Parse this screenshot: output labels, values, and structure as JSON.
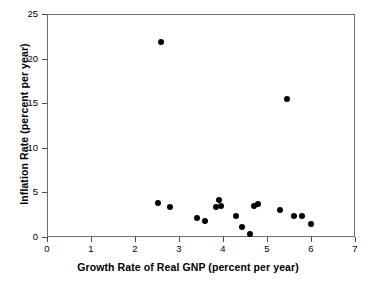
{
  "chart_data": {
    "type": "scatter",
    "title": "",
    "xlabel": "Growth Rate of Real GNP (percent per year)",
    "ylabel": "Inflation Rate (percent per year)",
    "xlim": [
      0,
      7
    ],
    "ylim": [
      0,
      25
    ],
    "xticks": [
      0,
      1,
      2,
      3,
      4,
      5,
      6,
      7
    ],
    "yticks": [
      0,
      5,
      10,
      15,
      20,
      25
    ],
    "grid": false,
    "legend": null,
    "marker": "filled-circle",
    "marker_color": "#000000",
    "points": [
      {
        "x": 2.6,
        "y": 21.9
      },
      {
        "x": 5.45,
        "y": 15.5
      },
      {
        "x": 2.52,
        "y": 3.8
      },
      {
        "x": 2.8,
        "y": 3.4
      },
      {
        "x": 3.4,
        "y": 2.1
      },
      {
        "x": 3.6,
        "y": 1.8
      },
      {
        "x": 3.83,
        "y": 3.4
      },
      {
        "x": 3.92,
        "y": 4.1
      },
      {
        "x": 3.95,
        "y": 3.5
      },
      {
        "x": 4.3,
        "y": 2.3
      },
      {
        "x": 4.43,
        "y": 1.1
      },
      {
        "x": 4.62,
        "y": 0.3
      },
      {
        "x": 4.7,
        "y": 3.5
      },
      {
        "x": 4.8,
        "y": 3.7
      },
      {
        "x": 5.3,
        "y": 3.0
      },
      {
        "x": 5.62,
        "y": 2.4
      },
      {
        "x": 5.8,
        "y": 2.3
      },
      {
        "x": 6.0,
        "y": 1.5
      }
    ]
  },
  "axes": {
    "x_tick_labels": [
      "0",
      "1",
      "2",
      "3",
      "4",
      "5",
      "6",
      "7"
    ],
    "y_tick_labels": [
      "0",
      "5",
      "10",
      "15",
      "20",
      "25"
    ]
  }
}
